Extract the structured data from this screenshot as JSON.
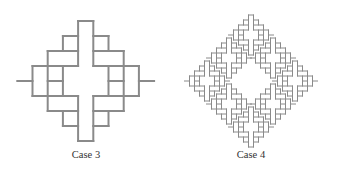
{
  "figure": {
    "panels": [
      {
        "label": "Case 3",
        "center_x": 86,
        "grid_origin": [
          32.5,
          21
        ],
        "cell": [
          15.2,
          15
        ],
        "copies": [
          [
            0,
            0,
            1
          ]
        ]
      },
      {
        "label": "Case 4",
        "center_x": 251,
        "cell": [
          5,
          5
        ],
        "copies": [
          [
            251,
            35,
            1
          ],
          [
            207,
            81,
            1
          ],
          [
            295,
            81,
            1
          ],
          [
            251,
            127,
            1
          ],
          [
            229,
            58,
            1
          ],
          [
            273,
            58,
            1
          ],
          [
            229,
            104,
            1
          ],
          [
            273,
            104,
            1
          ]
        ]
      }
    ],
    "line_color": "#8a8a8a",
    "line_width_case3": 2,
    "line_width_case4": 1,
    "segments_unit": [
      [
        3,
        0,
        4,
        0
      ],
      [
        3,
        0,
        3,
        3
      ],
      [
        4,
        0,
        4,
        3
      ],
      [
        2,
        1,
        3,
        1
      ],
      [
        2,
        1,
        2,
        2
      ],
      [
        4,
        1,
        5,
        1
      ],
      [
        5,
        1,
        5,
        2
      ],
      [
        1,
        2,
        3,
        2
      ],
      [
        1,
        2,
        1,
        6
      ],
      [
        4,
        2,
        6,
        2
      ],
      [
        6,
        2,
        6,
        6
      ],
      [
        0,
        3,
        3,
        3
      ],
      [
        4,
        3,
        7,
        3
      ],
      [
        0,
        3,
        0,
        5
      ],
      [
        7,
        3,
        7,
        5
      ],
      [
        2,
        3,
        2,
        5
      ],
      [
        5,
        3,
        5,
        5
      ],
      [
        1,
        4,
        2,
        4
      ],
      [
        5,
        4,
        6,
        4
      ],
      [
        -1,
        4,
        0,
        4
      ],
      [
        7,
        4,
        8,
        4
      ],
      [
        0,
        5,
        3,
        5
      ],
      [
        4,
        5,
        7,
        5
      ],
      [
        1,
        6,
        3,
        6
      ],
      [
        4,
        6,
        6,
        6
      ],
      [
        2,
        6,
        2,
        7
      ],
      [
        5,
        6,
        5,
        7
      ],
      [
        2,
        7,
        3,
        7
      ],
      [
        4,
        7,
        5,
        7
      ],
      [
        3,
        5,
        3,
        8
      ],
      [
        4,
        5,
        4,
        8
      ],
      [
        3,
        8,
        4,
        8
      ]
    ]
  }
}
